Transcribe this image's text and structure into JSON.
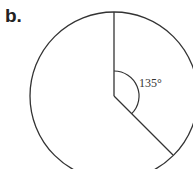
{
  "figure": {
    "label": "b.",
    "angle_label": "135°",
    "shape": "circle",
    "angle_degrees": 135,
    "colors": {
      "stroke": "#333333",
      "background": "#ffffff"
    }
  }
}
